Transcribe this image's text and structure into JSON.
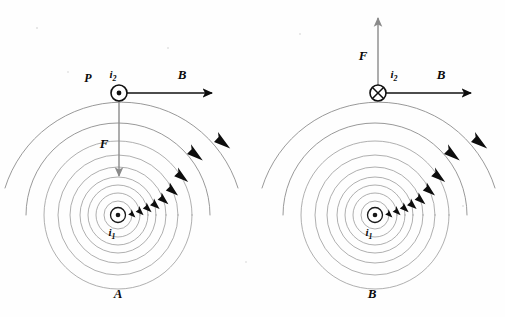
{
  "figure": {
    "background_color": "#fefefe",
    "ink_color": "#0d0d0d",
    "fieldline_color": "#9a9a9a"
  },
  "panels": [
    {
      "id": "A",
      "panel_label": "A",
      "panel_label_pos": {
        "x": 118,
        "y": 298
      },
      "source": {
        "symbol": "dot-in-circle",
        "meaning": "current out of page",
        "label": "i",
        "subscript": "1",
        "cx": 118,
        "cy": 215,
        "ring_r": 7.5,
        "dot_r": 2.3,
        "label_pos": {
          "x": 112,
          "y": 235
        }
      },
      "test_wire": {
        "symbol": "dot-in-circle",
        "meaning": "current out of page",
        "label": "i",
        "subscript": "2",
        "cx": 119,
        "cy": 93,
        "ring_r": 8.0,
        "dot_r": 2.4,
        "label_pos": {
          "x": 113,
          "y": 78
        }
      },
      "point_label": {
        "text": "P",
        "x": 88,
        "y": 82
      },
      "b_vector": {
        "label": "B",
        "label_pos": {
          "x": 182,
          "y": 79
        },
        "x1": 119,
        "y1": 93,
        "x2": 215,
        "y2": 93,
        "direction": "right",
        "color": "#111111"
      },
      "f_vector": {
        "label": "F",
        "label_pos": {
          "x": 104,
          "y": 148
        },
        "x1": 119,
        "y1": 101,
        "x2": 119,
        "y2": 178,
        "direction": "down",
        "color": "#8a8a8a"
      },
      "field_circles_radii": [
        14,
        22,
        30,
        38,
        48,
        60,
        74,
        92,
        122
      ],
      "arrowheads_count": 8
    },
    {
      "id": "B",
      "panel_label": "B",
      "panel_label_pos": {
        "x": 372,
        "y": 298
      },
      "source": {
        "symbol": "dot-in-circle",
        "meaning": "current out of page",
        "label": "i",
        "subscript": "1",
        "cx": 375,
        "cy": 215,
        "ring_r": 7.5,
        "dot_r": 2.3,
        "label_pos": {
          "x": 369,
          "y": 235
        }
      },
      "test_wire": {
        "symbol": "cross-in-circle",
        "meaning": "current into page",
        "label": "i",
        "subscript": "2",
        "cx": 378,
        "cy": 93,
        "ring_r": 8.0,
        "label_pos": {
          "x": 392,
          "y": 78
        }
      },
      "point_label": null,
      "b_vector": {
        "label": "B",
        "label_pos": {
          "x": 441,
          "y": 79
        },
        "x1": 378,
        "y1": 93,
        "x2": 474,
        "y2": 93,
        "direction": "right",
        "color": "#111111"
      },
      "f_vector": {
        "label": "F",
        "label_pos": {
          "x": 363,
          "y": 60
        },
        "x1": 378,
        "y1": 85,
        "x2": 378,
        "y2": 16,
        "direction": "up",
        "color": "#8a8a8a"
      },
      "field_circles_radii": [
        14,
        22,
        30,
        38,
        48,
        60,
        74,
        92,
        122
      ],
      "arrowheads_count": 8
    }
  ],
  "caption": {
    "field_direction": "clockwise",
    "description": "Magnetic field circles around current i1 and force on current i2"
  }
}
